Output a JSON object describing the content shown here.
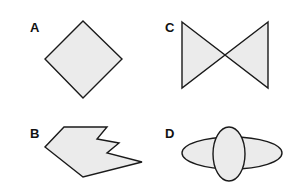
{
  "figure": {
    "background": "#ffffff",
    "fill_color": "#ebebeb",
    "stroke_color": "#1a1a1a",
    "panels": [
      {
        "id": "A",
        "label": "A",
        "shape": "diamond",
        "points": "83,21 122,59 83,98 45,59",
        "label_pos": [
          30,
          32
        ]
      },
      {
        "id": "B",
        "label": "B",
        "shape": "irregular-polygon",
        "points": "64,127 107,127 97,139 119,143 107,153 142,162 83,177 45,147",
        "label_pos": [
          30,
          138
        ]
      },
      {
        "id": "C",
        "label": "C",
        "shape": "bowtie",
        "points_left": "182,22 225,55 182,88",
        "points_right": "268,22 225,55 268,88",
        "label_pos": [
          165,
          32
        ]
      },
      {
        "id": "D",
        "label": "D",
        "shape": "overlapping-ellipses",
        "horizontal_ellipse": {
          "cx": 232,
          "cy": 153,
          "rx": 50,
          "ry": 16
        },
        "vertical_ellipse": {
          "cx": 229,
          "cy": 154,
          "rx": 16,
          "ry": 27
        },
        "label_pos": [
          165,
          138
        ]
      }
    ]
  }
}
